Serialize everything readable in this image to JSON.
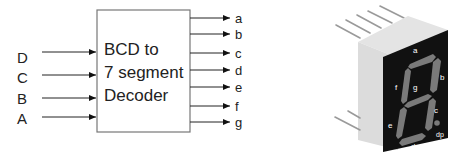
{
  "decoder": {
    "title_line1": "BCD  to",
    "title_line2": "7 segment",
    "title_line3": "Decoder",
    "inputs": [
      {
        "label": "D",
        "y": 52,
        "ly": 62
      },
      {
        "label": "C",
        "y": 75,
        "ly": 82
      },
      {
        "label": "B",
        "y": 98,
        "ly": 104
      },
      {
        "label": "A",
        "y": 117,
        "ly": 124
      }
    ],
    "outputs": [
      {
        "label": "a",
        "y": 18
      },
      {
        "label": "b",
        "y": 34
      },
      {
        "label": "c",
        "y": 53
      },
      {
        "label": "d",
        "y": 70
      },
      {
        "label": "e",
        "y": 87
      },
      {
        "label": "f",
        "y": 106
      },
      {
        "label": "g",
        "y": 122
      }
    ]
  },
  "display": {
    "segment_labels": {
      "a": "a",
      "b": "b",
      "c": "c",
      "d": "d",
      "e": "e",
      "f": "f",
      "g": "g",
      "dp": "dp"
    },
    "colors": {
      "body": "#d9d9d9",
      "body_top": "#e6e6e6",
      "face": "#111111",
      "segment": "#7a7a7a",
      "pin": "#9a9a9a"
    }
  }
}
